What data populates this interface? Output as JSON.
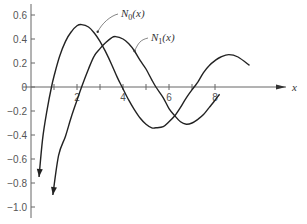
{
  "chart_data": {
    "type": "line",
    "title": "",
    "xlabel": "x",
    "ylabel": "",
    "xlim": [
      0,
      10
    ],
    "ylim": [
      -1.1,
      0.65
    ],
    "grid": false,
    "legend": "inline labels with leader lines",
    "x_ticks": [
      1,
      2,
      3,
      4,
      5,
      6,
      7,
      8
    ],
    "x_tick_labels": [
      "2",
      "4",
      "6",
      "8"
    ],
    "y_ticks": [
      0.6,
      0.4,
      0.2,
      0,
      -0.2,
      -0.4,
      -0.6,
      -0.8,
      -1.0
    ],
    "y_tick_labels": [
      "0.6",
      "0.4",
      "0.2",
      "0",
      "−0.2",
      "−0.4",
      "−0.6",
      "−0.8",
      "−1.0"
    ],
    "series": [
      {
        "name": "N0(x)",
        "label_main": "N",
        "label_sub": "0",
        "label_arg": "(x)",
        "x": [
          0.35,
          0.5,
          0.7,
          0.89,
          1.0,
          1.25,
          1.5,
          1.75,
          2.0,
          2.2,
          2.5,
          2.75,
          3.0,
          3.25,
          3.5,
          3.75,
          3.96,
          4.25,
          4.5,
          4.75,
          5.0,
          5.25,
          5.43,
          5.75,
          6.0,
          6.25,
          6.5,
          6.75,
          7.09,
          7.25,
          7.5,
          7.75,
          8.0,
          8.25,
          8.6,
          9.0,
          9.5
        ],
        "y": [
          -0.75,
          -0.44,
          -0.19,
          0.0,
          0.09,
          0.26,
          0.38,
          0.46,
          0.51,
          0.52,
          0.5,
          0.45,
          0.38,
          0.29,
          0.19,
          0.08,
          0.0,
          -0.11,
          -0.19,
          -0.26,
          -0.31,
          -0.34,
          -0.34,
          -0.33,
          -0.29,
          -0.24,
          -0.17,
          -0.09,
          0.0,
          0.04,
          0.12,
          0.18,
          0.22,
          0.25,
          0.27,
          0.25,
          0.18
        ]
      },
      {
        "name": "N1(x)",
        "label_main": "N",
        "label_sub": "1",
        "label_arg": "(x)",
        "x": [
          0.95,
          1.2,
          1.5,
          1.75,
          2.0,
          2.2,
          2.5,
          2.75,
          3.0,
          3.25,
          3.5,
          3.68,
          4.0,
          4.25,
          4.5,
          4.75,
          5.0,
          5.25,
          5.43,
          5.75,
          6.0,
          6.25,
          6.5,
          6.75,
          7.0,
          7.25,
          7.5,
          7.75,
          8.0,
          8.2
        ],
        "y": [
          -0.9,
          -0.57,
          -0.41,
          -0.25,
          -0.11,
          0.0,
          0.15,
          0.26,
          0.32,
          0.37,
          0.41,
          0.42,
          0.4,
          0.36,
          0.3,
          0.22,
          0.15,
          0.06,
          0.0,
          -0.09,
          -0.18,
          -0.24,
          -0.29,
          -0.31,
          -0.3,
          -0.27,
          -0.23,
          -0.17,
          -0.11,
          -0.06
        ]
      }
    ],
    "annotations": [
      {
        "text": "N0(x)",
        "points_to": [
          2.9,
          0.46
        ]
      },
      {
        "text": "N1(x)",
        "points_to": [
          4.5,
          0.3
        ]
      }
    ]
  }
}
